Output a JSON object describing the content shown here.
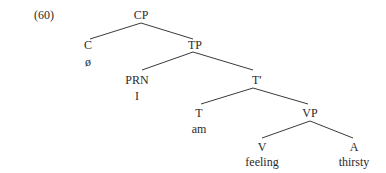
{
  "example_number": "(60)",
  "tree": {
    "CP": {
      "label": "CP"
    },
    "C": {
      "label": "C",
      "word": "ø"
    },
    "TP": {
      "label": "TP"
    },
    "PRN": {
      "label": "PRN",
      "word": "I"
    },
    "Tbar": {
      "label": "T′"
    },
    "T": {
      "label": "T",
      "word": "am"
    },
    "VP": {
      "label": "VP"
    },
    "V": {
      "label": "V",
      "word": "feeling"
    },
    "A": {
      "label": "A",
      "word": "thirsty"
    }
  },
  "edges": [
    [
      "CP",
      "C"
    ],
    [
      "CP",
      "TP"
    ],
    [
      "TP",
      "PRN"
    ],
    [
      "TP",
      "Tbar"
    ],
    [
      "Tbar",
      "T"
    ],
    [
      "Tbar",
      "VP"
    ],
    [
      "VP",
      "V"
    ],
    [
      "VP",
      "A"
    ]
  ]
}
